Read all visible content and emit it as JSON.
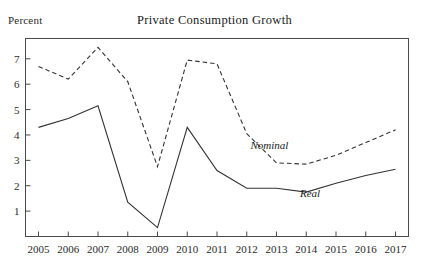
{
  "chart_data": {
    "type": "line",
    "title": "Private Consumption Growth",
    "xlabel": "",
    "ylabel": "Percent",
    "ylim": [
      0,
      7.8
    ],
    "xlim": [
      2005,
      2017
    ],
    "grid": false,
    "legend_position": "inline-annotation",
    "x": [
      2005,
      2006,
      2007,
      2008,
      2009,
      2010,
      2011,
      2012,
      2013,
      2014,
      2015,
      2016,
      2017
    ],
    "yticks": [
      1,
      2,
      3,
      4,
      5,
      6,
      7
    ],
    "ytick_labels": [
      "1",
      "2",
      "3",
      "4",
      "5",
      "6",
      "7"
    ],
    "xtick_labels": [
      "2005",
      "2006",
      "2007",
      "2008",
      "2009",
      "2010",
      "2011",
      "2012",
      "2013",
      "2014",
      "2015",
      "2016",
      "2017"
    ],
    "series": [
      {
        "name": "Nominal",
        "style": "dashed",
        "color": "#333333",
        "values": [
          6.7,
          6.2,
          7.45,
          6.1,
          2.75,
          6.95,
          6.8,
          4.05,
          2.9,
          2.85,
          3.2,
          3.7,
          4.2
        ]
      },
      {
        "name": "Real",
        "style": "solid",
        "color": "#333333",
        "values": [
          4.3,
          4.65,
          5.15,
          1.35,
          0.35,
          4.3,
          2.6,
          1.9,
          1.9,
          1.75,
          2.1,
          2.4,
          2.65
        ]
      }
    ],
    "annotations": [
      {
        "text": "Nominal",
        "x": 2012.05,
        "y": 3.45
      },
      {
        "text": "Real",
        "x": 2013.6,
        "y": 1.55
      }
    ]
  }
}
